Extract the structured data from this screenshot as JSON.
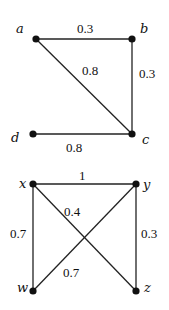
{
  "graphs": [
    {
      "nodes": [
        {
          "id": "a",
          "label": "a",
          "x": 36,
          "y": 39,
          "lx": 16,
          "ly": 33
        },
        {
          "id": "b",
          "label": "b",
          "x": 132,
          "y": 39,
          "lx": 140,
          "ly": 33
        },
        {
          "id": "c",
          "label": "c",
          "x": 132,
          "y": 134,
          "lx": 142,
          "ly": 144
        },
        {
          "id": "d",
          "label": "d",
          "x": 33,
          "y": 134,
          "lx": 11,
          "ly": 142
        }
      ],
      "edges": [
        {
          "from": "a",
          "to": "b",
          "weight": "0.3",
          "wx": 77,
          "wy": 33
        },
        {
          "from": "b",
          "to": "c",
          "weight": "0.3",
          "wx": 139,
          "wy": 78
        },
        {
          "from": "a",
          "to": "c",
          "weight": "0.8",
          "wx": 82,
          "wy": 75
        },
        {
          "from": "d",
          "to": "c",
          "weight": "0.8",
          "wx": 66,
          "wy": 152
        }
      ]
    },
    {
      "nodes": [
        {
          "id": "x",
          "label": "x",
          "x": 33,
          "y": 184,
          "lx": 19,
          "ly": 188
        },
        {
          "id": "y",
          "label": "y",
          "x": 136,
          "y": 184,
          "lx": 143,
          "ly": 189
        },
        {
          "id": "w",
          "label": "w",
          "x": 33,
          "y": 291,
          "lx": 17,
          "ly": 292
        },
        {
          "id": "z",
          "label": "z",
          "x": 136,
          "y": 291,
          "lx": 144,
          "ly": 292
        }
      ],
      "edges": [
        {
          "from": "x",
          "to": "y",
          "weight": "1",
          "wx": 79,
          "wy": 180
        },
        {
          "from": "x",
          "to": "w",
          "weight": "0.7",
          "wx": 10,
          "wy": 238
        },
        {
          "from": "y",
          "to": "z",
          "weight": "0.3",
          "wx": 141,
          "wy": 238
        },
        {
          "from": "x",
          "to": "z",
          "weight": "0.4",
          "wx": 64,
          "wy": 216
        },
        {
          "from": "w",
          "to": "y",
          "weight": "0.7",
          "wx": 63,
          "wy": 277
        }
      ]
    }
  ]
}
